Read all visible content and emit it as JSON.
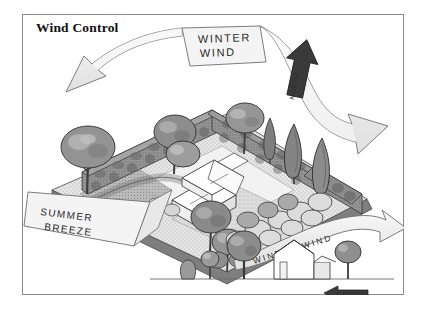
{
  "figure": {
    "title": "Wind Control",
    "border_color": "#8a8a8a",
    "background": "#ffffff",
    "width": 423,
    "height": 310
  },
  "palette": {
    "ink": "#2a2a2a",
    "arrow_fill": "#efefef",
    "arrow_stroke": "#6e6e6e",
    "north_arrow_fill": "#3a3a3a",
    "hedge_dark": "#8e8e8e",
    "hedge_darker": "#6f6f6f",
    "tree_mid": "#9a9a9a",
    "tree_light": "#c9c9c9",
    "ground_light": "#ededed",
    "ground_mid": "#cfcfcf",
    "ground_dark": "#a8a8a8",
    "house_white": "#ffffff"
  },
  "annotations": {
    "winter_wind_top": {
      "text_line1": "WINTER",
      "text_line2": "WIND",
      "style": "hand-lettered",
      "position": "top-center"
    },
    "north_arrow_top": {
      "text": "NORTH",
      "direction": "up",
      "position": "top-right"
    },
    "summer_breeze": {
      "text_line1": "SUMMER",
      "text_line2": "BREEZE",
      "style": "hand-lettered",
      "position": "left-lower",
      "direction": "from-lower-left"
    },
    "winter_wind_inset": {
      "text": "WINTER WIND",
      "style": "hand-lettered-on-banner",
      "position": "bottom-right",
      "direction": "right"
    },
    "north_arrow_inset": {
      "text": "NORTH",
      "direction": "left",
      "position": "bottom-right"
    }
  },
  "scene": {
    "type": "isometric-site-plan",
    "description": "Residential lot shown in axonometric view with a white house at center, dense evergreen hedgerows along the north and east property lines, deciduous shade trees, and low shrub massing to the south.",
    "elements": [
      {
        "name": "house",
        "label": "house",
        "count": 1
      },
      {
        "name": "hedgerow-north",
        "label": "windbreak hedge",
        "count": 1
      },
      {
        "name": "hedgerow-east",
        "label": "windbreak hedge",
        "count": 1
      },
      {
        "name": "deciduous-tree",
        "label": "deciduous tree",
        "count": 6
      },
      {
        "name": "conifer-tree",
        "label": "conifer",
        "count": 3
      },
      {
        "name": "shrub-mass",
        "label": "shrub massing",
        "count": 12
      },
      {
        "name": "lawn",
        "label": "lawn",
        "count": 1
      },
      {
        "name": "driveway",
        "label": "driveway",
        "count": 1
      }
    ]
  },
  "inset": {
    "type": "elevation-section",
    "description": "Side elevation showing winter wind deflected up and over a row of trees and the house.",
    "elements": [
      {
        "name": "shrub",
        "label": "shrub",
        "count": 1
      },
      {
        "name": "small-tree",
        "label": "small tree",
        "count": 1
      },
      {
        "name": "large-tree",
        "label": "large tree",
        "count": 1
      },
      {
        "name": "house",
        "label": "house",
        "count": 1
      },
      {
        "name": "side-tree",
        "label": "tree",
        "count": 1
      },
      {
        "name": "ground-line",
        "label": "grade",
        "count": 1
      }
    ]
  }
}
